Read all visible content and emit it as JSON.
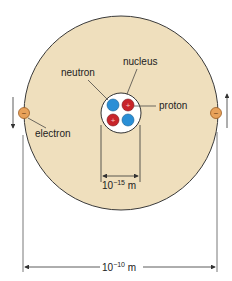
{
  "diagram": {
    "colors": {
      "atom_fill": "#efdfbd",
      "atom_stroke": "#3a3a3a",
      "neutron": "#2a8fd6",
      "proton": "#c8242a",
      "electron": "#e8a25a",
      "line": "#333333"
    },
    "labels": {
      "nucleus": "nucleus",
      "neutron": "neutron",
      "proton": "proton",
      "electron": "electron",
      "proton_sign": "+",
      "electron_sign": "−"
    },
    "dimensions": {
      "nucleus_size": "10",
      "nucleus_exp": "−15",
      "nucleus_unit": " m",
      "atom_size": "10",
      "atom_exp": "−10",
      "atom_unit": " m"
    }
  }
}
